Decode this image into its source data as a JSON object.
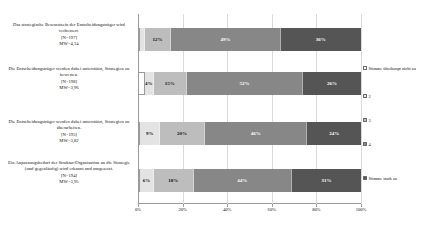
{
  "chart_data": {
    "type": "bar",
    "orientation": "horizontal",
    "stacked": true,
    "normalized": "100%",
    "title": "",
    "xlabel": "",
    "ylabel": "",
    "xlim": [
      0,
      100
    ],
    "grid": true,
    "legend_position": "right",
    "xticks": [
      "0%",
      "20%",
      "40%",
      "60%",
      "80%",
      "100%"
    ],
    "xtick_values": [
      0,
      20,
      40,
      60,
      80,
      100
    ],
    "legend": [
      "Stimme überhaupt nicht zu",
      "2",
      "3",
      "4",
      "Stimme stark zu"
    ],
    "series": [
      {
        "name": "Stimme überhaupt nicht zu",
        "color": "#ffffff",
        "values": [
          1,
          3,
          1,
          1
        ]
      },
      {
        "name": "2",
        "color": "#e3e3e3",
        "values": [
          2,
          4,
          9,
          6
        ]
      },
      {
        "name": "3",
        "color": "#bdbdbd",
        "values": [
          12,
          15,
          20,
          18
        ]
      },
      {
        "name": "4",
        "color": "#878787",
        "values": [
          49,
          52,
          46,
          44
        ]
      },
      {
        "name": "Stimme stark zu",
        "color": "#555555",
        "values": [
          36,
          26,
          24,
          31
        ]
      }
    ],
    "categories": [
      {
        "label": "Das strategische Bewusstsein der Entscheidungsträger wird verbessert.",
        "n": "[N=197]",
        "mw": "MW=4,14",
        "segments": [
          {
            "value": 1,
            "label": ""
          },
          {
            "value": 2,
            "label": ""
          },
          {
            "value": 12,
            "label": "12%"
          },
          {
            "value": 49,
            "label": "49%"
          },
          {
            "value": 36,
            "label": "36%"
          }
        ]
      },
      {
        "label": "Die Entscheidungsträger werden dabei unterstützt, Strategien zu bewerten.",
        "n": "[N=198]",
        "mw": "MW=3,96",
        "segments": [
          {
            "value": 3,
            "label": ""
          },
          {
            "value": 4,
            "label": "4%"
          },
          {
            "value": 15,
            "label": "15%"
          },
          {
            "value": 52,
            "label": "52%"
          },
          {
            "value": 26,
            "label": "26%"
          }
        ]
      },
      {
        "label": "Die Entscheidungsträger werden dabei unterstützt, Strategien zu überarbeiten.",
        "n": "[N=195]",
        "mw": "MW=3,82",
        "segments": [
          {
            "value": 1,
            "label": ""
          },
          {
            "value": 9,
            "label": "9%"
          },
          {
            "value": 20,
            "label": "20%"
          },
          {
            "value": 46,
            "label": "46%"
          },
          {
            "value": 24,
            "label": "24%"
          }
        ]
      },
      {
        "label": "Ein Anpassungsbedarf der Struktur/Organisation an die Strategie (und gegenläufig) wird erkannt und umgesetzt.",
        "n": "[N=194]",
        "mw": "MW=3,95",
        "segments": [
          {
            "value": 1,
            "label": ""
          },
          {
            "value": 6,
            "label": "6%"
          },
          {
            "value": 18,
            "label": "18%"
          },
          {
            "value": 44,
            "label": "44%"
          },
          {
            "value": 31,
            "label": "31%"
          }
        ]
      }
    ]
  },
  "caption": ""
}
